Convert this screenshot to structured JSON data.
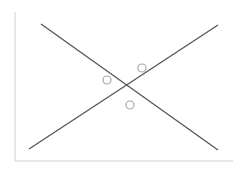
{
  "diagram": {
    "width": 242,
    "height": 174,
    "colors": {
      "background": "#ffffff",
      "axis": "#d0d0d0",
      "line": "#555555",
      "circle": "#a8a8a8"
    },
    "axes": {
      "y_axis": {
        "x": 15,
        "y1": 12,
        "y2": 161
      },
      "x_axis": {
        "y": 161,
        "x1": 15,
        "x2": 233
      }
    },
    "lines": [
      {
        "name": "descending-line",
        "x1": 41,
        "y1": 24,
        "x2": 218,
        "y2": 150
      },
      {
        "name": "ascending-line",
        "x1": 29,
        "y1": 149,
        "x2": 218,
        "y2": 25
      }
    ],
    "points": [
      {
        "name": "point-left",
        "cx": 107,
        "cy": 80,
        "r": 4
      },
      {
        "name": "point-upper-right",
        "cx": 142,
        "cy": 68,
        "r": 4
      },
      {
        "name": "point-below",
        "cx": 130,
        "cy": 105,
        "r": 4
      }
    ]
  }
}
